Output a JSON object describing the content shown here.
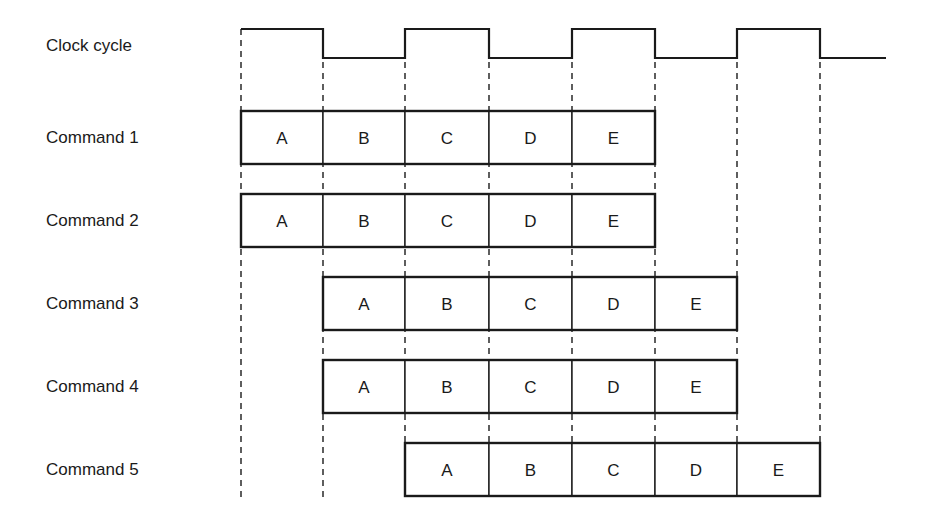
{
  "diagram": {
    "title": "",
    "clock": {
      "label": "Clock cycle",
      "edges_x": [
        241,
        323,
        405,
        489,
        572,
        655,
        737,
        820
      ],
      "start_level": "high",
      "end_x": 886,
      "high_y": 29,
      "low_y": 58
    },
    "stages": [
      "A",
      "B",
      "C",
      "D",
      "E"
    ],
    "commands": [
      {
        "label": "Command 1",
        "start_cycle": 0,
        "stages": [
          "A",
          "B",
          "C",
          "D",
          "E"
        ]
      },
      {
        "label": "Command 2",
        "start_cycle": 0,
        "stages": [
          "A",
          "B",
          "C",
          "D",
          "E"
        ]
      },
      {
        "label": "Command 3",
        "start_cycle": 1,
        "stages": [
          "A",
          "B",
          "C",
          "D",
          "E"
        ]
      },
      {
        "label": "Command 4",
        "start_cycle": 1,
        "stages": [
          "A",
          "B",
          "C",
          "D",
          "E"
        ]
      },
      {
        "label": "Command 5",
        "start_cycle": 2,
        "stages": [
          "A",
          "B",
          "C",
          "D",
          "E"
        ]
      }
    ],
    "colors": {
      "line": "#1a1a1a",
      "background": "#ffffff"
    }
  }
}
